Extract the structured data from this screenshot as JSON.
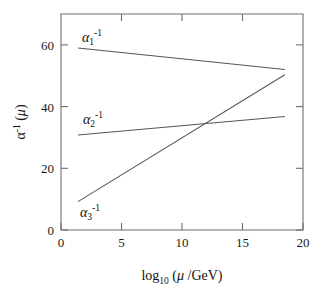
{
  "chart_data": {
    "type": "line",
    "title": "",
    "xlabel": "log10 (μ /GeV)",
    "ylabel": "α-1 (μ)",
    "xlim": [
      0,
      20
    ],
    "ylim": [
      0,
      70
    ],
    "grid": false,
    "legend_position": "inline-labels",
    "xticks": [
      0,
      5,
      10,
      15,
      20
    ],
    "xtick_labels": [
      "0",
      "5",
      "10",
      "15",
      "20"
    ],
    "yticks": [
      0,
      20,
      40,
      60
    ],
    "ytick_labels": [
      "0",
      "20",
      "40",
      "60"
    ],
    "x": [
      1.4,
      18.5
    ],
    "series": [
      {
        "name": "alpha_1_inverse",
        "label": "α₁⁻¹",
        "color": "#555555",
        "x": [
          1.4,
          18.5
        ],
        "values": [
          59.0,
          52.0
        ],
        "annotation": {
          "text": "α₁⁻¹",
          "x": 2.6,
          "y": 64.5
        }
      },
      {
        "name": "alpha_2_inverse",
        "label": "α₂⁻¹",
        "color": "#555555",
        "x": [
          1.4,
          18.5
        ],
        "values": [
          30.8,
          36.8
        ],
        "annotation": {
          "text": "α₂⁻¹",
          "x": 2.7,
          "y": 40.5
        }
      },
      {
        "name": "alpha_3_inverse",
        "label": "α₃⁻¹",
        "color": "#555555",
        "x": [
          1.4,
          18.5
        ],
        "values": [
          9.2,
          50.3
        ],
        "annotation": {
          "text": "α₃⁻¹",
          "x": 2.5,
          "y": 7.5
        }
      }
    ],
    "axis_label_parts": {
      "y_base": "α",
      "y_sup": "-1",
      "y_arg": "(μ)",
      "x_base": "log",
      "x_sub": "10",
      "x_arg": "(μ /GeV)"
    },
    "curve_label_parts": [
      {
        "base": "α",
        "sub": "1",
        "sup": "-1"
      },
      {
        "base": "α",
        "sub": "2",
        "sup": "-1"
      },
      {
        "base": "α",
        "sub": "3",
        "sup": "-1"
      }
    ]
  }
}
